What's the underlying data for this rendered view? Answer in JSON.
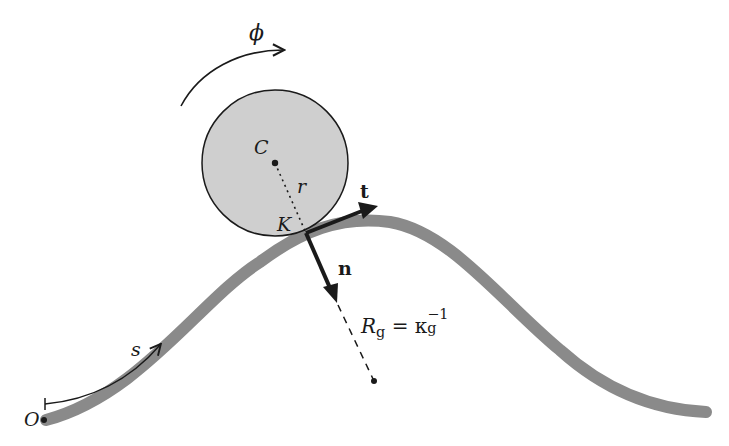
{
  "diagram": {
    "colors": {
      "curve": "#8a8a8a",
      "disk_fill": "#cfcfcf",
      "disk_stroke": "#1a1a1a",
      "vectors": "#1a1a1a",
      "background": "#ffffff"
    },
    "labels": {
      "phi": "ϕ",
      "center": "C",
      "radius": "r",
      "contact": "K",
      "tangent": "t",
      "normal": "n",
      "origin": "O",
      "arclength": "s",
      "radius_of_curvature": {
        "R": "R",
        "R_sub": "g",
        "equals": "=",
        "kappa": "κ",
        "kappa_sub": "g",
        "kappa_sup": "−1"
      }
    }
  }
}
